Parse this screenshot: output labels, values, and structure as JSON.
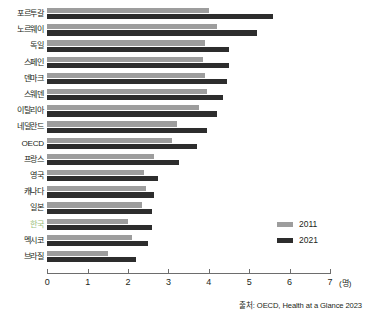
{
  "chart_data": {
    "type": "bar",
    "orientation": "horizontal",
    "title": "",
    "xlabel": "(명)",
    "ylabel": "",
    "xlim": [
      0,
      7
    ],
    "xticks": [
      0,
      1,
      2,
      3,
      4,
      5,
      6,
      7
    ],
    "grid": false,
    "legend_position": "right-bottom-inside",
    "categories": [
      "포르투갈",
      "노르웨이",
      "독일",
      "스페인",
      "덴마크",
      "스웨덴",
      "이탈리아",
      "네덜란드",
      "OECD",
      "프랑스",
      "영국",
      "캐나다",
      "일본",
      "한국",
      "멕시코",
      "브라질"
    ],
    "highlight_category": "한국",
    "highlight_color": "#9bbf7e",
    "series": [
      {
        "name": "2011",
        "color": "#9d9d9d",
        "values": [
          4.0,
          4.2,
          3.9,
          3.85,
          3.9,
          3.95,
          3.75,
          3.2,
          3.1,
          2.65,
          2.4,
          2.45,
          2.35,
          2.0,
          2.1,
          1.5
        ]
      },
      {
        "name": "2021",
        "color": "#2d2d2d",
        "values": [
          5.6,
          5.2,
          4.5,
          4.5,
          4.45,
          4.35,
          4.2,
          3.95,
          3.7,
          3.25,
          2.75,
          2.65,
          2.6,
          2.6,
          2.5,
          2.2
        ]
      }
    ]
  },
  "legend": {
    "items": [
      {
        "label": "2011",
        "color": "#9d9d9d"
      },
      {
        "label": "2021",
        "color": "#2d2d2d"
      }
    ]
  },
  "axis": {
    "unit_label": "(명)",
    "tick_labels": [
      "0",
      "1",
      "2",
      "3",
      "4",
      "5",
      "6",
      "7"
    ]
  },
  "source": {
    "text": "출처: OECD, Health at a Glance 2023"
  }
}
